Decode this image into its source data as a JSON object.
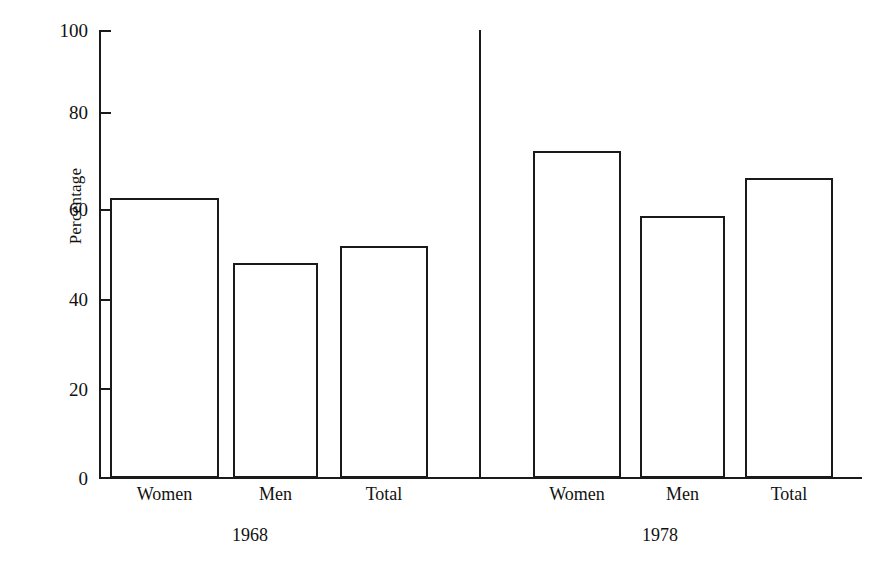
{
  "chart_data": {
    "type": "bar",
    "title": "",
    "subtitle": "",
    "xlabel": "",
    "ylabel": "Percentage",
    "ylim": [
      0,
      100
    ],
    "yticks": [
      0,
      20,
      40,
      60,
      80,
      100
    ],
    "ytick_labels": [
      "0",
      "20",
      "40",
      "60",
      "80",
      "100"
    ],
    "grid": false,
    "legend": "none",
    "groups": [
      {
        "name": "1968",
        "categories": [
          "Women",
          "Men",
          "Total"
        ],
        "values": [
          62.5,
          48.0,
          51.8
        ]
      },
      {
        "name": "1978",
        "categories": [
          "Women",
          "Men",
          "Total"
        ],
        "values": [
          73.0,
          58.5,
          67.0
        ]
      }
    ],
    "categories": [
      "Women",
      "Men",
      "Total",
      "Women",
      "Men",
      "Total"
    ],
    "values": [
      62.5,
      48.0,
      51.8,
      73.0,
      58.5,
      67.0
    ],
    "colors": {
      "bar_fill": "#ffffff",
      "bar_stroke": "#1a1a1a",
      "axis": "#1a1a1a",
      "text": "#111111",
      "background": "#ffffff"
    }
  },
  "axis": {
    "y_title": "Percentage",
    "ticks": [
      {
        "label": "100",
        "value": 100
      },
      {
        "label": "80",
        "value": 80
      },
      {
        "label": "60",
        "value": 60
      },
      {
        "label": "40",
        "value": 40
      },
      {
        "label": "20",
        "value": 20
      },
      {
        "label": "0",
        "value": 0
      }
    ]
  },
  "bars": [
    {
      "label": "Women",
      "value": 62.5,
      "group": "1968"
    },
    {
      "label": "Men",
      "value": 48.0,
      "group": "1968"
    },
    {
      "label": "Total",
      "value": 51.8,
      "group": "1968"
    },
    {
      "label": "Women",
      "value": 73.0,
      "group": "1978"
    },
    {
      "label": "Men",
      "value": 58.5,
      "group": "1978"
    },
    {
      "label": "Total",
      "value": 67.0,
      "group": "1978"
    }
  ],
  "groups": [
    {
      "label": "1968"
    },
    {
      "label": "1978"
    }
  ]
}
